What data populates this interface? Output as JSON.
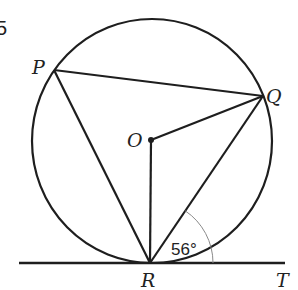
{
  "question_number_fragment": "5",
  "diagram": {
    "colors": {
      "stroke": "#1e1e1e",
      "thin_arc": "#8a8a8a",
      "text": "#222222",
      "background": "#ffffff"
    },
    "circle": {
      "center": "O",
      "cx": 152,
      "cy": 142,
      "r": 121
    },
    "points": {
      "P": {
        "label": "P",
        "x": 54,
        "y": 70
      },
      "Q": {
        "label": "Q",
        "x": 263,
        "y": 96
      },
      "O": {
        "label": "O",
        "x": 151,
        "y": 140
      },
      "R": {
        "label": "R",
        "x": 150,
        "y": 263
      },
      "T": {
        "label": "T"
      }
    },
    "segments": [
      "PQ",
      "PR",
      "QR",
      "OQ",
      "OR"
    ],
    "tangent_line": {
      "from_x": 19,
      "to_x": 285,
      "y": 263,
      "through": "R",
      "towards": "T"
    },
    "angle": {
      "name": "QRT",
      "value": "56°",
      "vertex": "R"
    }
  }
}
